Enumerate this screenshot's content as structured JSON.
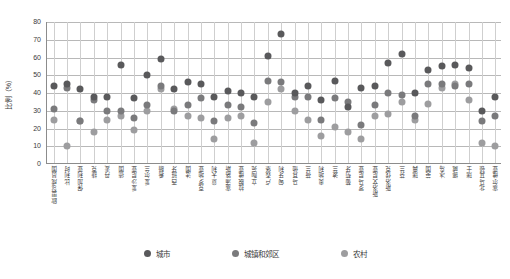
{
  "chart_data": {
    "type": "scatter",
    "title": "",
    "xlabel": "",
    "ylabel": "比例（%）",
    "ylim": [
      0,
      80
    ],
    "yticks": [
      0,
      10,
      20,
      30,
      40,
      50,
      60,
      70,
      80
    ],
    "grid": true,
    "legend_position": "bottom",
    "categories": [
      "欧盟28成员国",
      "比利时",
      "保加利亚",
      "捷克",
      "丹麦",
      "德国",
      "爱沙尼亚",
      "爱尔兰",
      "希腊",
      "西班牙",
      "法国",
      "克罗地亚",
      "意大利",
      "塞浦路斯",
      "拉脱维亚",
      "立陶宛",
      "卢森堡",
      "匈牙利",
      "马耳他",
      "荷兰",
      "奥地利",
      "波兰",
      "葡萄牙",
      "罗马尼亚",
      "斯洛文尼亚",
      "斯洛伐克",
      "芬兰",
      "瑞典",
      "英国",
      "冰岛",
      "挪威",
      "瑞士",
      "北马其顿",
      "塞尔维亚"
    ],
    "series": [
      {
        "name": "城市",
        "color": "#59595b",
        "values": [
          44,
          45,
          42,
          38,
          38,
          56,
          37,
          50,
          59,
          42,
          46,
          45,
          38,
          41,
          40,
          38,
          61,
          73,
          40,
          44,
          36,
          47,
          32,
          43,
          44,
          57,
          62,
          40,
          53,
          55,
          56,
          54,
          30,
          38
        ]
      },
      {
        "name": "城镇和郊区",
        "color": "#7a7a7c",
        "values": [
          31,
          43,
          24,
          36,
          30,
          30,
          26,
          33,
          44,
          30,
          33,
          37,
          24,
          33,
          32,
          23,
          47,
          46,
          38,
          38,
          25,
          37,
          35,
          22,
          33,
          40,
          39,
          27,
          45,
          45,
          44,
          45,
          24,
          27
        ]
      },
      {
        "name": "农村",
        "color": "#9d9d9f",
        "values": [
          25,
          10,
          24,
          18,
          25,
          27,
          19,
          30,
          42,
          31,
          27,
          26,
          14,
          26,
          27,
          12,
          35,
          42,
          30,
          25,
          16,
          21,
          18,
          14,
          27,
          28,
          35,
          25,
          34,
          43,
          45,
          36,
          12,
          10
        ]
      }
    ]
  },
  "axis": {
    "y_title": "比例（%）"
  }
}
